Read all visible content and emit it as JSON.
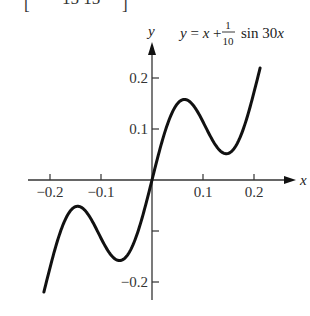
{
  "header_fragment": {
    "left_bracket": "[",
    "text": "15  15",
    "right_bracket": "]"
  },
  "chart_data": {
    "type": "line",
    "title_parts": {
      "lhs": "y = x +",
      "frac_num": "1",
      "frac_den": "10",
      "rhs": "sin 30x"
    },
    "function": "y = x + 0.1*sin(30*x)",
    "xlabel": "x",
    "ylabel": "y",
    "xlim": [
      -0.22,
      0.22
    ],
    "ylim": [
      -0.25,
      0.25
    ],
    "x_ticks": [
      -0.2,
      -0.1,
      0.1,
      0.2
    ],
    "x_tick_labels": [
      "−0.2",
      "−0.1",
      "0.1",
      "0.2"
    ],
    "y_ticks": [
      0.2,
      0.1,
      -0.1,
      -0.2
    ],
    "y_tick_labels": [
      "0.2",
      "0.1",
      "",
      "−0.2"
    ],
    "grid": false,
    "legend": null,
    "series": [
      {
        "name": "y = x + (1/10) sin 30x",
        "x": [
          -0.21,
          -0.18,
          -0.15,
          -0.1419,
          -0.12,
          -0.09,
          -0.0675,
          -0.06,
          -0.03,
          0.0,
          0.03,
          0.06,
          0.0675,
          0.09,
          0.12,
          0.1419,
          0.15,
          0.18,
          0.21
        ],
        "y": [
          -0.2512,
          -0.1028,
          -0.0522,
          -0.0467,
          -0.0754,
          -0.1327,
          -0.1578,
          -0.1574,
          -0.1083,
          0.0,
          0.1083,
          0.1574,
          0.1578,
          0.1327,
          0.0754,
          0.0467,
          0.0522,
          0.1028,
          0.2512
        ]
      }
    ],
    "extrema": {
      "local_max": [
        {
          "x": -0.1419,
          "y": -0.0467
        },
        {
          "x": 0.0675,
          "y": 0.1578
        }
      ],
      "local_min": [
        {
          "x": -0.0675,
          "y": -0.1578
        },
        {
          "x": 0.1419,
          "y": 0.0467
        }
      ]
    }
  },
  "plot": {
    "origin_px": [
      152,
      180
    ],
    "px_per_unit": 510,
    "x_min": -0.212,
    "x_max": 0.212,
    "samples": 240,
    "line_color": "#111111",
    "axis_color": "#333333"
  }
}
